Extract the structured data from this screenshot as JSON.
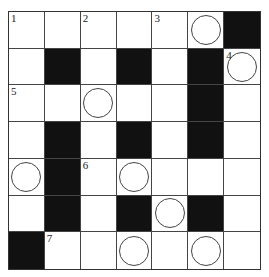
{
  "puzzle": {
    "rows": 7,
    "cols": 7,
    "grid": [
      [
        {
          "n": "1"
        },
        {},
        {
          "n": "2"
        },
        {},
        {
          "n": "3"
        },
        {
          "circle": true
        },
        {
          "black": true
        }
      ],
      [
        {},
        {
          "black": true
        },
        {},
        {
          "black": true
        },
        {},
        {
          "black": true
        },
        {
          "n": "4",
          "circle": true
        }
      ],
      [
        {
          "n": "5"
        },
        {},
        {
          "circle": true
        },
        {},
        {},
        {
          "black": true
        },
        {}
      ],
      [
        {},
        {
          "black": true
        },
        {},
        {
          "black": true
        },
        {},
        {
          "black": true
        },
        {}
      ],
      [
        {
          "circle": true
        },
        {
          "black": true
        },
        {
          "n": "6"
        },
        {
          "circle": true
        },
        {},
        {},
        {}
      ],
      [
        {},
        {
          "black": true
        },
        {},
        {
          "black": true
        },
        {
          "circle": true
        },
        {
          "black": true
        },
        {}
      ],
      [
        {
          "black": true
        },
        {
          "n": "7"
        },
        {},
        {
          "circle": true
        },
        {},
        {
          "circle": true
        },
        {}
      ]
    ]
  }
}
